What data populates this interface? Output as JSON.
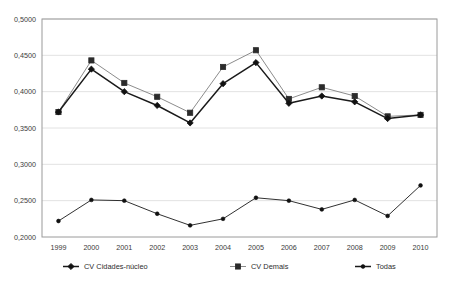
{
  "chart_data": {
    "type": "line",
    "title": "",
    "subtitle": "",
    "xlabel": "",
    "ylabel": "",
    "x": [
      "1999",
      "2000",
      "2001",
      "2002",
      "2003",
      "2004",
      "2005",
      "2006",
      "2007",
      "2008",
      "2009",
      "2010"
    ],
    "categories": [
      "1999",
      "2000",
      "2001",
      "2002",
      "2003",
      "2004",
      "2005",
      "2006",
      "2007",
      "2008",
      "2009",
      "2010"
    ],
    "ylim": [
      0.2,
      0.5
    ],
    "ytick_values": [
      0.2,
      0.25,
      0.3,
      0.35,
      0.4,
      0.45,
      0.5
    ],
    "ytick_labels": [
      "0,2000",
      "0,2500",
      "0,3000",
      "0,3500",
      "0,4000",
      "0,4500",
      "0,5000"
    ],
    "grid": true,
    "grid_axis": "y",
    "legend_position": "bottom",
    "series": [
      {
        "name": "CV Cidades-núcleo",
        "marker": "diamond",
        "color": "#1a1a1a",
        "values": [
          0.372,
          0.431,
          0.4,
          0.381,
          0.357,
          0.411,
          0.44,
          0.384,
          0.394,
          0.386,
          0.363,
          0.368
        ]
      },
      {
        "name": "CV Demais",
        "marker": "square",
        "color": "#8c8c8c",
        "values": [
          0.372,
          0.443,
          0.412,
          0.393,
          0.371,
          0.434,
          0.457,
          0.39,
          0.406,
          0.394,
          0.366,
          0.368
        ]
      },
      {
        "name": "Todas",
        "marker": "dot",
        "color": "#1a1a1a",
        "values": [
          0.222,
          0.251,
          0.25,
          0.232,
          0.216,
          0.225,
          0.254,
          0.25,
          0.238,
          0.251,
          0.229,
          0.271
        ]
      }
    ]
  },
  "legend": {
    "items": [
      {
        "label": "CV Cidades-núcleo"
      },
      {
        "label": "CV Demais"
      },
      {
        "label": "Todas"
      }
    ]
  },
  "colors": {
    "plot_border": "#9a9a9a",
    "gridline": "#e2e2e2",
    "series_dark": "#1a1a1a",
    "series_gray": "#8c8c8c",
    "text": "#3a3a3a",
    "background": "#ffffff"
  }
}
